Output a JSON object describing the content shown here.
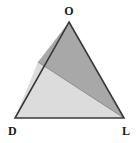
{
  "figure": {
    "name": "shaded-triangle-diagram",
    "background_color": "#ffffff",
    "outline_color": "#3a3a3a",
    "outline_width": 1.6,
    "vertices": {
      "top": {
        "label": "O",
        "x": 69,
        "y": 22
      },
      "bottom_left": {
        "label": "D",
        "x": 15,
        "y": 118
      },
      "bottom_right": {
        "label": "L",
        "x": 124,
        "y": 118
      }
    },
    "divider": {
      "name": "cevian-line",
      "from_label": "P",
      "from": {
        "x": 38,
        "y": 62
      },
      "to_label": "L",
      "to": {
        "x": 124,
        "y": 118
      },
      "color": "#8c8c8c",
      "width": 1.0
    },
    "regions": [
      {
        "name": "upper-right-region",
        "fill": "#a8a8a8",
        "description": "darker gray region bounded by O, P and L"
      },
      {
        "name": "lower-left-region",
        "fill": "#dcdcdc",
        "description": "lighter gray region bounded by P, D and L"
      }
    ],
    "labels": {
      "top_vertex": "O",
      "bottom_left_vertex": "D",
      "bottom_right_vertex": "L"
    }
  }
}
